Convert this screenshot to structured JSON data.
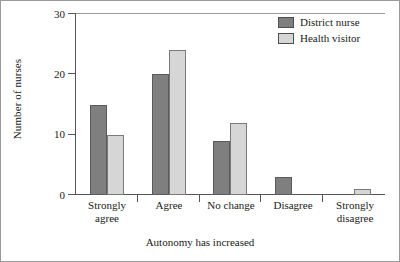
{
  "chart_data": {
    "type": "bar",
    "title": "",
    "xlabel": "Autonomy has increased",
    "ylabel": "Number of nurses",
    "categories": [
      "Strongly agree",
      "Agree",
      "No change",
      "Disagree",
      "Strongly disagree"
    ],
    "category_lines": [
      [
        "Strongly",
        "agree"
      ],
      [
        "Agree"
      ],
      [
        "No change"
      ],
      [
        "Disagree"
      ],
      [
        "Strongly",
        "disagree"
      ]
    ],
    "series": [
      {
        "name": "District nurse",
        "color": "#7f7f7f",
        "values": [
          15,
          20,
          9,
          3,
          0
        ]
      },
      {
        "name": "Health visitor",
        "color": "#d6d6d6",
        "values": [
          10,
          24,
          12,
          0,
          1
        ]
      }
    ],
    "ylim": [
      0,
      30
    ],
    "yticks": [
      0,
      10,
      20,
      30
    ],
    "ytick_labels": [
      "0",
      "10",
      "20",
      "30"
    ],
    "grid": false,
    "legend_position": "top-right"
  }
}
